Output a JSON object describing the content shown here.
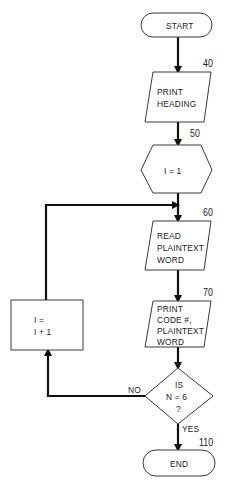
{
  "flowchart": {
    "start": {
      "label": "START"
    },
    "step40": {
      "number": "40",
      "line1": "PRINT",
      "line2": "HEADING"
    },
    "step50": {
      "number": "50",
      "label": "I = 1"
    },
    "step60": {
      "number": "60",
      "line1": "READ",
      "line2": "PLAINTEXT",
      "line3": "WORD"
    },
    "step70": {
      "number": "70",
      "line1": "PRINT",
      "line2": "CODE #,",
      "line3": "PLAINTEXT",
      "line4": "WORD"
    },
    "increment": {
      "line1": "I =",
      "line2": "I + 1"
    },
    "decision": {
      "line1": "IS",
      "line2": "N = 6",
      "line3": "?",
      "no_label": "NO",
      "yes_label": "YES"
    },
    "end": {
      "number": "110",
      "label": "END"
    }
  },
  "colors": {
    "stroke": "#111111",
    "shape_border": "#3a3a3a",
    "background": "#ffffff"
  }
}
